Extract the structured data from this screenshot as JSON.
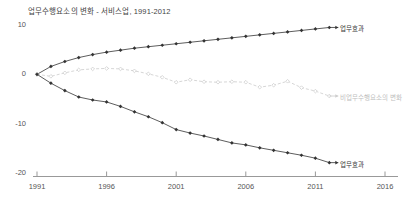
{
  "chart_data": {
    "type": "line",
    "title": "업무수행요소의 변화 - 서비스업, 1991-2012",
    "xlabel": "",
    "ylabel": "",
    "xlim": [
      1991,
      2016
    ],
    "ylim": [
      -20,
      10
    ],
    "x_ticks": [
      "1991",
      "1996",
      "2001",
      "2006",
      "2011",
      "2016"
    ],
    "y_ticks": [
      "10",
      "0",
      "-10",
      "-20"
    ],
    "grid": false,
    "legend_position": "inline-end-of-line",
    "x": [
      1991,
      1992,
      1993,
      1994,
      1995,
      1996,
      1997,
      1998,
      1999,
      2000,
      2001,
      2002,
      2003,
      2004,
      2005,
      2006,
      2007,
      2008,
      2009,
      2010,
      2011,
      2012
    ],
    "series": [
      {
        "name": "업무효과",
        "color": "#333333",
        "marker": "filled-diamond",
        "line_style": "solid",
        "end_label": "업무효과",
        "values": [
          0.0,
          1.6,
          2.6,
          3.4,
          4.0,
          4.5,
          4.9,
          5.3,
          5.6,
          5.9,
          6.2,
          6.5,
          6.8,
          7.1,
          7.4,
          7.7,
          8.0,
          8.3,
          8.6,
          8.9,
          9.2,
          9.5
        ]
      },
      {
        "name": "비업무수행요소의 변화",
        "color": "#cccccc",
        "marker": "open-diamond",
        "line_style": "dashed",
        "end_label": "비업무수행요소의 변화",
        "values": [
          0.0,
          -0.4,
          0.3,
          0.9,
          1.1,
          1.2,
          1.1,
          0.7,
          0.1,
          -0.6,
          -1.6,
          -1.1,
          -1.5,
          -1.6,
          -1.5,
          -1.6,
          -2.6,
          -2.2,
          -1.4,
          -2.7,
          -3.4,
          -4.4
        ]
      },
      {
        "name": "업무효과",
        "color": "#333333",
        "marker": "filled-diamond",
        "line_style": "solid",
        "end_label": "업무효과",
        "values": [
          0.0,
          -1.8,
          -3.3,
          -4.6,
          -5.2,
          -5.6,
          -6.5,
          -7.6,
          -8.6,
          -9.8,
          -11.2,
          -11.9,
          -12.5,
          -13.2,
          -13.9,
          -14.3,
          -14.9,
          -15.4,
          -15.9,
          -16.4,
          -17.0,
          -17.9
        ]
      }
    ]
  }
}
